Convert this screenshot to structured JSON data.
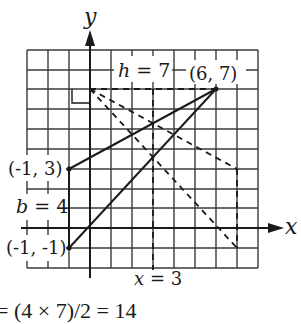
{
  "diagram": {
    "type": "coordinate-plane-triangle-area",
    "axes": {
      "x_label": "x",
      "y_label": "y",
      "x_range": [
        -3,
        8
      ],
      "y_range": [
        -2,
        9
      ]
    },
    "points": [
      {
        "label": "(6, 7)",
        "x": 6,
        "y": 7
      },
      {
        "label": "(-1, 3)",
        "x": -1,
        "y": 3
      },
      {
        "label": "(-1, -1)",
        "x": -1,
        "y": -1
      }
    ],
    "annotations": {
      "height": "h = 7",
      "base": "b = 4",
      "vertical_line": "x = 3"
    },
    "formula": "= (4 × 7)/2 = 14",
    "colors": {
      "ink": "#1a1a1a",
      "grid": "#3a3a3a",
      "background": "#ffffff"
    }
  }
}
